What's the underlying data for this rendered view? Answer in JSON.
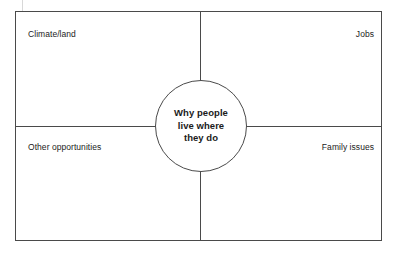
{
  "diagram": {
    "title": "Why people live where they do",
    "center": {
      "text": "Why people\nlive where\nthey do"
    },
    "quadrants": [
      {
        "id": "top-left",
        "label": "Climate/land"
      },
      {
        "id": "top-right",
        "label": "Jobs"
      },
      {
        "id": "bottom-left",
        "label": "Other opportunities"
      },
      {
        "id": "bottom-right",
        "label": "Family issues"
      }
    ],
    "style": {
      "line_color": "#4a4a4a",
      "text_color": "#1b1b1b",
      "background": "#ffffff"
    }
  },
  "chart_data": {
    "type": "diagram",
    "subtype": "four-quadrant-hub-and-spoke",
    "title": "Why people live where they do",
    "hub": "Why people live where they do",
    "categories": [
      "Climate/land",
      "Jobs",
      "Other opportunities",
      "Family issues"
    ],
    "layout": {
      "hub_position": "center",
      "quadrant_order": [
        "top-left",
        "top-right",
        "bottom-left",
        "bottom-right"
      ],
      "label_alignment": [
        "left",
        "right",
        "left",
        "right"
      ],
      "grid": true,
      "legend": "none"
    }
  }
}
